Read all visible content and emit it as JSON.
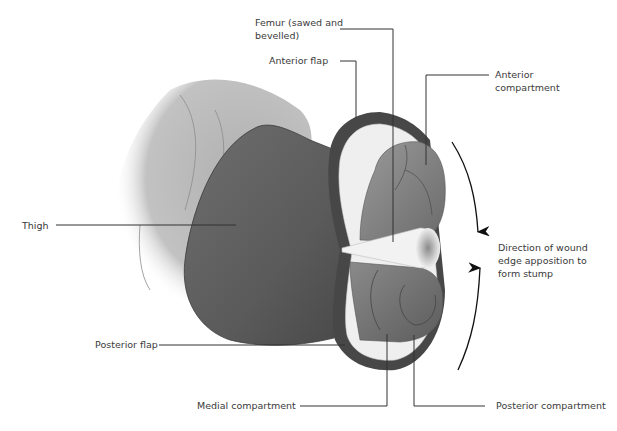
{
  "diagram": {
    "labels": {
      "femur": "Femur (sawed and\nbevelled)",
      "anterior_flap": "Anterior flap",
      "anterior_compartment": "Anterior\ncompartment",
      "thigh": "Thigh",
      "direction": "Direction of wound\nedge apposition to\nform stump",
      "posterior_flap": "Posterior flap",
      "medial_compartment": "Medial compartment",
      "posterior_compartment": "Posterior compartment"
    },
    "colors": {
      "skin_dark": "#5a5a5a",
      "skin_light": "#b5b5b5",
      "flap_edge": "#444444",
      "fat_layer": "#efefef",
      "muscle": "#808080",
      "bone": "#f2f2f2",
      "leader_line": "#333333",
      "text": "#3a3a3a"
    }
  }
}
